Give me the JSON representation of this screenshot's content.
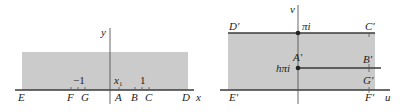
{
  "colors": {
    "region_fill": "#cbcbcb",
    "line": "#3a3a3a",
    "axis": "#555555",
    "text": "#222222",
    "background": "#ffffff"
  },
  "left_plane": {
    "axis_labels": {
      "horizontal": "x",
      "vertical": "y"
    },
    "tick_labels": [
      {
        "text": "−1",
        "x": 78
      },
      {
        "text": "x",
        "sub": "1",
        "x": 118
      },
      {
        "text": "1",
        "x": 142
      }
    ],
    "points": [
      {
        "label": "E",
        "x": 22
      },
      {
        "label": "F",
        "x": 71
      },
      {
        "label": "G",
        "x": 85
      },
      {
        "label": "A",
        "x": 119
      },
      {
        "label": "B",
        "x": 135
      },
      {
        "label": "C",
        "x": 149
      },
      {
        "label": "D",
        "x": 186
      }
    ]
  },
  "right_plane": {
    "axis_labels": {
      "horizontal": "u",
      "vertical": "v"
    },
    "marked_values": [
      {
        "text": "πi",
        "y": 33
      },
      {
        "text": "hπi",
        "y": 68
      }
    ],
    "points": [
      {
        "label": "D′",
        "pos": "top-left"
      },
      {
        "label": "C′",
        "pos": "top-right"
      },
      {
        "label": "A′",
        "pos": "slit-tip"
      },
      {
        "label": "B′",
        "pos": "slit-upper-right"
      },
      {
        "label": "G′",
        "pos": "slit-lower-right"
      },
      {
        "label": "E′",
        "pos": "bottom-left"
      },
      {
        "label": "F′",
        "pos": "bottom-right"
      }
    ]
  }
}
